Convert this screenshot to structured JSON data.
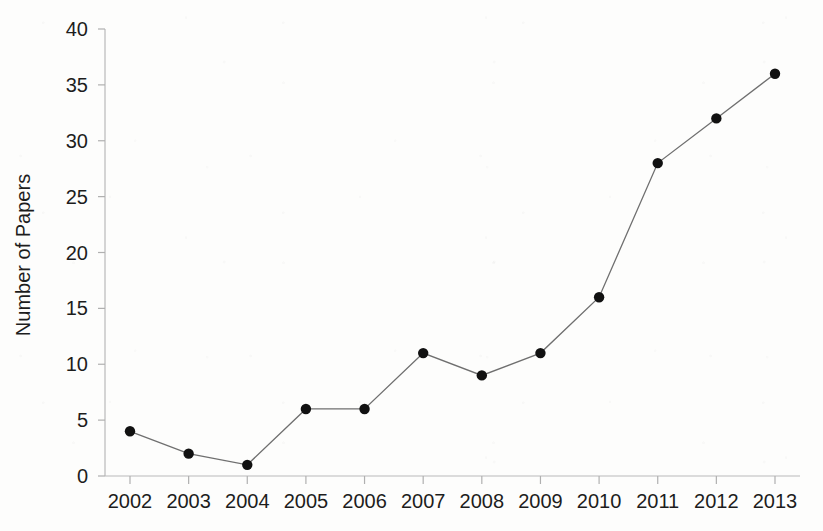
{
  "chart_data": {
    "type": "line",
    "title": "",
    "subtitle": "",
    "xlabel": "",
    "ylabel": "Number of Papers",
    "categories": [
      "2002",
      "2003",
      "2004",
      "2005",
      "2006",
      "2007",
      "2008",
      "2009",
      "2010",
      "2011",
      "2012",
      "2013"
    ],
    "values": [
      4,
      2,
      1,
      6,
      6,
      11,
      9,
      11,
      16,
      28,
      32,
      36
    ],
    "series": [
      {
        "name": "Number of Papers",
        "values": [
          4,
          2,
          1,
          6,
          6,
          11,
          9,
          11,
          16,
          28,
          32,
          36
        ]
      }
    ],
    "ylim": [
      0,
      40
    ],
    "ytick_labels": [
      "0",
      "5",
      "10",
      "15",
      "20",
      "25",
      "30",
      "35",
      "40"
    ],
    "ytick_values": [
      0,
      5,
      10,
      15,
      20,
      25,
      30,
      35,
      40
    ],
    "xtick_labels": [
      "2002",
      "2003",
      "2004",
      "2005",
      "2006",
      "2007",
      "2008",
      "2009",
      "2010",
      "2011",
      "2012",
      "2013"
    ],
    "grid": false,
    "legend": false,
    "legend_position": "none",
    "annotations": [],
    "marker": "circle",
    "colors": {
      "line": "#6f6f6f",
      "marker": "#111111",
      "axis": "#b9b9b9",
      "text": "#1d1d1d",
      "background": "#fdfdfc"
    }
  }
}
